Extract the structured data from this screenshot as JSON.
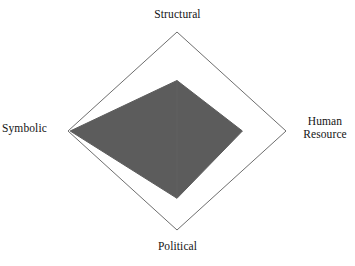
{
  "chart_data": {
    "type": "radar",
    "title": "",
    "categories": [
      "Structural",
      "Human Resource",
      "Political",
      "Symbolic"
    ],
    "series": [
      {
        "name": "Frame emphasis",
        "values": [
          1.02,
          1.2,
          1.36,
          1.96
        ]
      }
    ],
    "rmin": 0,
    "rmax": 2,
    "rings": [
      1,
      2
    ],
    "grid": true,
    "legend": false,
    "legend_position": "none",
    "xlabel": "",
    "ylabel": "",
    "tick_labels": [],
    "annotations": [],
    "fill_color": "#5c5c5c",
    "grid_color": "#6e6e6e",
    "background_color": "#ffffff"
  },
  "labels": {
    "structural": "Structural",
    "human_resource": "Human\nResource",
    "political": "Political",
    "symbolic": "Symbolic"
  },
  "geometry": {
    "center_x": 177,
    "center_y": 131,
    "radius_x": 109,
    "radius_y": 99
  }
}
